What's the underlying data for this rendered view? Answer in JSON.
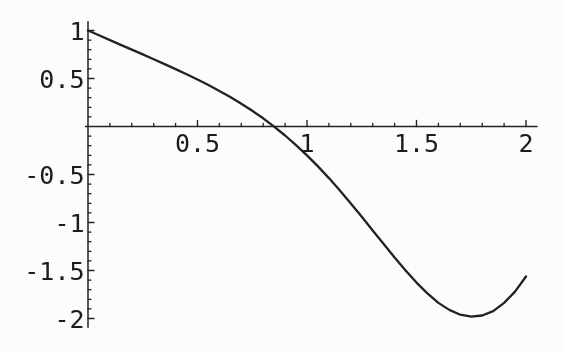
{
  "figure": {
    "background": "#fcfcfa",
    "ink": "#222222",
    "label_color": "#1b1b1b"
  },
  "chart_data": {
    "type": "line",
    "title": "",
    "xlabel": "",
    "ylabel": "",
    "grid": false,
    "legend": null,
    "axis_style": "axes-crossing-at-origin",
    "xlim": [
      0,
      2.05
    ],
    "ylim": [
      -2.09,
      1.09
    ],
    "x_major_ticks": [
      0.5,
      1,
      1.5,
      2
    ],
    "x_major_tick_labels": [
      "0.5",
      "1",
      "1.5",
      "2"
    ],
    "y_major_ticks": [
      1,
      0.5,
      -0.5,
      -1,
      -1.5,
      -2
    ],
    "y_major_tick_labels": [
      "1",
      "0.5",
      "-0.5",
      "-1",
      "-1.5",
      "-2"
    ],
    "minor_tick_step": 0.1,
    "series": [
      {
        "name": "curve",
        "x": [
          0,
          0.05,
          0.1,
          0.15,
          0.2,
          0.25,
          0.3,
          0.35,
          0.4,
          0.45,
          0.5,
          0.55,
          0.6,
          0.65,
          0.7,
          0.75,
          0.8,
          0.85,
          0.9,
          0.95,
          1.0,
          1.05,
          1.1,
          1.15,
          1.2,
          1.25,
          1.3,
          1.35,
          1.4,
          1.45,
          1.5,
          1.55,
          1.6,
          1.65,
          1.7,
          1.75,
          1.8,
          1.85,
          1.9,
          1.95,
          2.0
        ],
        "y": [
          1.0,
          0.95,
          0.9,
          0.85,
          0.801,
          0.751,
          0.7,
          0.65,
          0.598,
          0.545,
          0.49,
          0.432,
          0.371,
          0.307,
          0.238,
          0.164,
          0.085,
          -0.001,
          -0.094,
          -0.194,
          -0.301,
          -0.416,
          -0.538,
          -0.667,
          -0.802,
          -0.941,
          -1.083,
          -1.224,
          -1.365,
          -1.499,
          -1.626,
          -1.739,
          -1.837,
          -1.91,
          -1.96,
          -1.981,
          -1.969,
          -1.923,
          -1.837,
          -1.72,
          -1.563
        ]
      }
    ],
    "key_points": {
      "start": [
        0,
        1.0
      ],
      "zero_crossing_x": 0.85,
      "minimum": [
        1.76,
        -1.98
      ],
      "end": [
        2.0,
        -1.56
      ]
    }
  }
}
